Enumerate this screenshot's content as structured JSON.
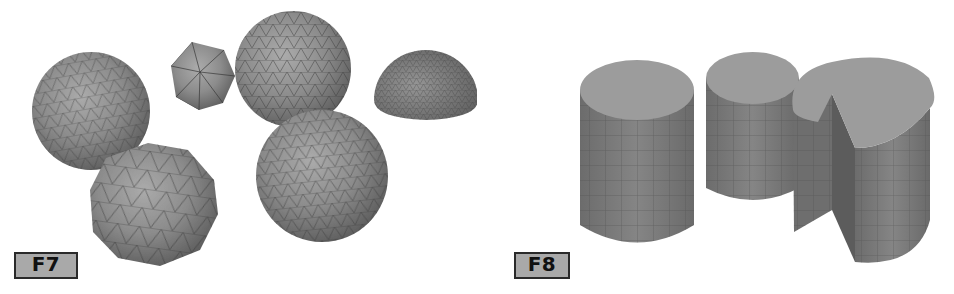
{
  "figures": [
    {
      "id": "F7",
      "label": "F7",
      "subject": "tessellated spheres",
      "shapes": [
        {
          "name": "geodesic-sphere-left",
          "kind": "sphere",
          "cx": 91,
          "cy": 111,
          "r": 59
        },
        {
          "name": "icosahedron",
          "kind": "icosahedron",
          "cx": 203,
          "cy": 74,
          "r": 33
        },
        {
          "name": "geodesic-sphere-top",
          "kind": "sphere",
          "cx": 293,
          "cy": 69,
          "r": 58
        },
        {
          "name": "hemisphere-fine",
          "kind": "hemisphere",
          "cx": 426,
          "cy": 98,
          "r": 52
        },
        {
          "name": "low-poly-sphere",
          "kind": "sphere-lowpoly",
          "cx": 154,
          "cy": 203,
          "r": 62
        },
        {
          "name": "geodesic-sphere-bottom",
          "kind": "sphere",
          "cx": 322,
          "cy": 176,
          "r": 66
        }
      ]
    },
    {
      "id": "F8",
      "label": "F8",
      "subject": "tessellated cylinders",
      "shapes": [
        {
          "name": "cylinder-tall",
          "kind": "cylinder"
        },
        {
          "name": "cylinder-short",
          "kind": "cylinder"
        },
        {
          "name": "cylinder-cut-wedge",
          "kind": "cylinder-wedge"
        }
      ]
    }
  ],
  "colors": {
    "background": "#ffffff",
    "mesh_fill": "#8a8a8a",
    "mesh_highlight": "#a8a8a8",
    "mesh_shadow": "#5a5a5a",
    "mesh_lines": "#3c3c3c",
    "cylinder_top": "#9c9c9c",
    "cylinder_side": "#7a7a7a",
    "label_fill": "#a9a9a9",
    "label_border": "#2a2a2a",
    "label_text": "#111111"
  }
}
